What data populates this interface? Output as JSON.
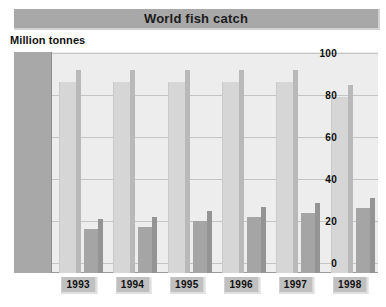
{
  "chart_data": {
    "type": "bar",
    "title": "World fish catch",
    "subtitle": "Million tonnes",
    "xlabel": "",
    "ylabel": "Million tonnes",
    "categories": [
      "1993",
      "1994",
      "1995",
      "1996",
      "1997",
      "1998"
    ],
    "series": [
      {
        "name": "series-1",
        "values": [
          86,
          86,
          86,
          86,
          86,
          79
        ]
      },
      {
        "name": "series-2",
        "values": [
          16,
          17,
          20,
          22,
          24,
          26
        ]
      }
    ],
    "ylim": [
      0,
      100
    ],
    "yticks": [
      100,
      80,
      60,
      40,
      20,
      0
    ],
    "ytick_labels": [
      "100",
      "80",
      "60",
      "40",
      "20",
      "0"
    ],
    "grid": true,
    "legend": "none",
    "colors": {
      "title_band": "#a8a8a8",
      "plot_background": "#ededed",
      "axis_strip": "#a8a8a8",
      "gridline": "#c4c4c4",
      "series1": "#d6d6d6",
      "series1_side": "#b9b9b9",
      "series2": "#a5a5a5",
      "series2_side": "#949494",
      "label_box": "#c0c0c0",
      "text": "#101010"
    }
  }
}
